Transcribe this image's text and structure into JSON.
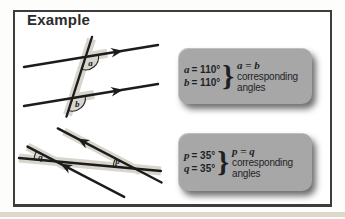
{
  "page": {
    "background": "#fdfdfb",
    "frame_border_color": "#3d3d3d",
    "footer_strip_color": "#dcd8ca"
  },
  "header": {
    "title": "Example"
  },
  "diagram_colors": {
    "line": "#1c1c1c",
    "highlight": "#d8d5cc",
    "label": "#1c1c1c"
  },
  "diagrams": {
    "top": {
      "angle_a": "a",
      "angle_b": "b"
    },
    "bottom": {
      "angle_q": "q",
      "angle_p": "p"
    }
  },
  "callouts": [
    {
      "equations": [
        {
          "var": "a",
          "rest": "= 110°"
        },
        {
          "var": "b",
          "rest": "= 110°"
        }
      ],
      "brace": "}",
      "result": "a = b",
      "desc_line1": "corresponding",
      "desc_line2": "angles",
      "bg": "#a7a7a7",
      "text_color": "#1f1f26"
    },
    {
      "equations": [
        {
          "var": "p",
          "rest": "= 35°"
        },
        {
          "var": "q",
          "rest": "= 35°"
        }
      ],
      "brace": "}",
      "result": "p = q",
      "desc_line1": "corresponding",
      "desc_line2": "angles",
      "bg": "#a7a7a7",
      "text_color": "#1f1f26"
    }
  ]
}
